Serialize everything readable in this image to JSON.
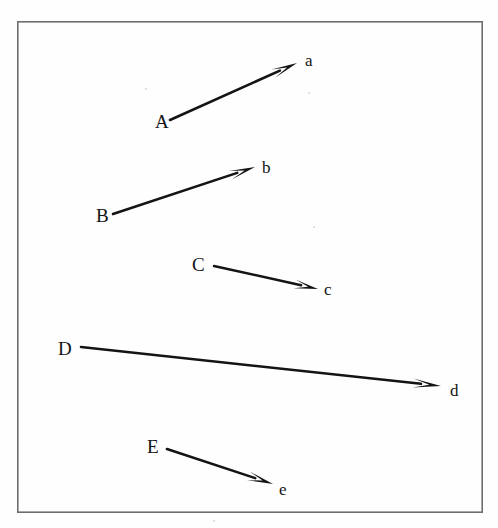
{
  "figure": {
    "type": "arrow-diagram",
    "background_color": "#fefefe",
    "ink_color": "#141414",
    "border": {
      "visible": true,
      "color": "#6e6e72",
      "thickness_px": 1.6,
      "x": 17,
      "y": 21,
      "width": 466,
      "height": 492
    },
    "canvas": {
      "width": 498,
      "height": 528
    },
    "arrows": [
      {
        "id": "arrow-a",
        "source_label": "A",
        "target_label": "a",
        "source_label_x": 155,
        "source_label_y": 127,
        "target_label_x": 305,
        "target_label_y": 66,
        "x1": 170,
        "y1": 120,
        "x2": 297,
        "y2": 63,
        "stroke_width": 2.6,
        "head_length": 26,
        "head_width": 9
      },
      {
        "id": "arrow-b",
        "source_label": "B",
        "target_label": "b",
        "source_label_x": 96,
        "source_label_y": 221,
        "target_label_x": 262,
        "target_label_y": 173,
        "x1": 113,
        "y1": 214,
        "x2": 255,
        "y2": 167,
        "stroke_width": 2.6,
        "head_length": 26,
        "head_width": 9
      },
      {
        "id": "arrow-c",
        "source_label": "C",
        "target_label": "c",
        "source_label_x": 192,
        "source_label_y": 270,
        "target_label_x": 324,
        "target_label_y": 295,
        "x1": 214,
        "y1": 266,
        "x2": 318,
        "y2": 289,
        "stroke_width": 2.4,
        "head_length": 24,
        "head_width": 9
      },
      {
        "id": "arrow-d",
        "source_label": "D",
        "target_label": "d",
        "source_label_x": 58,
        "source_label_y": 354,
        "target_label_x": 450,
        "target_label_y": 396,
        "x1": 81,
        "y1": 347,
        "x2": 441,
        "y2": 386,
        "stroke_width": 2.6,
        "head_length": 28,
        "head_width": 9
      },
      {
        "id": "arrow-e",
        "source_label": "E",
        "target_label": "e",
        "source_label_x": 147,
        "source_label_y": 452,
        "target_label_x": 279,
        "target_label_y": 495,
        "x1": 167,
        "y1": 449,
        "x2": 273,
        "y2": 484,
        "stroke_width": 2.6,
        "head_length": 26,
        "head_width": 9
      }
    ],
    "labels": {
      "uppercase": [
        "A",
        "B",
        "C",
        "D",
        "E"
      ],
      "lowercase": [
        "a",
        "b",
        "c",
        "d",
        "e"
      ]
    }
  }
}
